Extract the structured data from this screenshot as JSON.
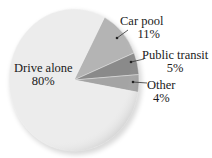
{
  "chart_data": {
    "type": "pie",
    "title": "",
    "categories": [
      "Drive alone",
      "Car pool",
      "Public transit",
      "Other"
    ],
    "values": [
      80,
      11,
      5,
      4
    ],
    "unit": "%",
    "labels": [
      {
        "name": "Drive alone",
        "value": "80%"
      },
      {
        "name": "Car pool",
        "value": "11%"
      },
      {
        "name": "Public transit",
        "value": "5%"
      },
      {
        "name": "Other",
        "value": "4%"
      }
    ],
    "colors": [
      "#ececec",
      "#b4b4b4",
      "#8a8a8a",
      "#a4a4a4"
    ],
    "legend": "none (direct labels with leader arrows)",
    "grid": false
  }
}
